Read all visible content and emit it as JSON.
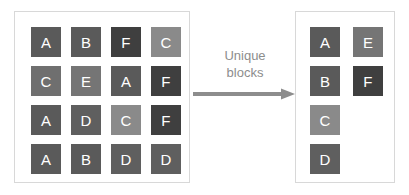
{
  "diagram": {
    "title": "Unique blocks",
    "transform": {
      "label": "Unique\nblocks",
      "arrow_color": "#8d8d8d",
      "label_color": "#8d8d8d",
      "direction": "left-to-right"
    },
    "panels": {
      "source": {
        "name": "source-blocks-panel",
        "border_color": "#d8d8d8",
        "columns": 4,
        "rows": 4,
        "blocks": [
          {
            "letter": "A",
            "color": "#5a5a5a",
            "row": 1,
            "col": 1
          },
          {
            "letter": "B",
            "color": "#5a5a5a",
            "row": 1,
            "col": 2
          },
          {
            "letter": "F",
            "color": "#3f3f3f",
            "row": 1,
            "col": 3
          },
          {
            "letter": "C",
            "color": "#8a8a8a",
            "row": 1,
            "col": 4
          },
          {
            "letter": "C",
            "color": "#6f6f6f",
            "row": 2,
            "col": 1
          },
          {
            "letter": "E",
            "color": "#757575",
            "row": 2,
            "col": 2
          },
          {
            "letter": "A",
            "color": "#5a5a5a",
            "row": 2,
            "col": 3
          },
          {
            "letter": "F",
            "color": "#3f3f3f",
            "row": 2,
            "col": 4
          },
          {
            "letter": "A",
            "color": "#5a5a5a",
            "row": 3,
            "col": 1
          },
          {
            "letter": "D",
            "color": "#5f5f5f",
            "row": 3,
            "col": 2
          },
          {
            "letter": "C",
            "color": "#8a8a8a",
            "row": 3,
            "col": 3
          },
          {
            "letter": "F",
            "color": "#3f3f3f",
            "row": 3,
            "col": 4
          },
          {
            "letter": "A",
            "color": "#5a5a5a",
            "row": 4,
            "col": 1
          },
          {
            "letter": "B",
            "color": "#5a5a5a",
            "row": 4,
            "col": 2
          },
          {
            "letter": "D",
            "color": "#5f5f5f",
            "row": 4,
            "col": 3
          },
          {
            "letter": "D",
            "color": "#5f5f5f",
            "row": 4,
            "col": 4
          }
        ]
      },
      "result": {
        "name": "unique-blocks-panel",
        "border_color": "#d8d8d8",
        "columns": 2,
        "rows": 3,
        "blocks": [
          {
            "letter": "A",
            "color": "#5a5a5a",
            "row": 1,
            "col": 1
          },
          {
            "letter": "E",
            "color": "#757575",
            "row": 1,
            "col": 2
          },
          {
            "letter": "B",
            "color": "#5a5a5a",
            "row": 2,
            "col": 1
          },
          {
            "letter": "F",
            "color": "#3f3f3f",
            "row": 2,
            "col": 2
          },
          {
            "letter": "C",
            "color": "#8a8a8a",
            "row": 3,
            "col": 1
          },
          {
            "letter": "D",
            "color": "#5f5f5f",
            "row": 4,
            "col": 1
          }
        ]
      }
    }
  }
}
